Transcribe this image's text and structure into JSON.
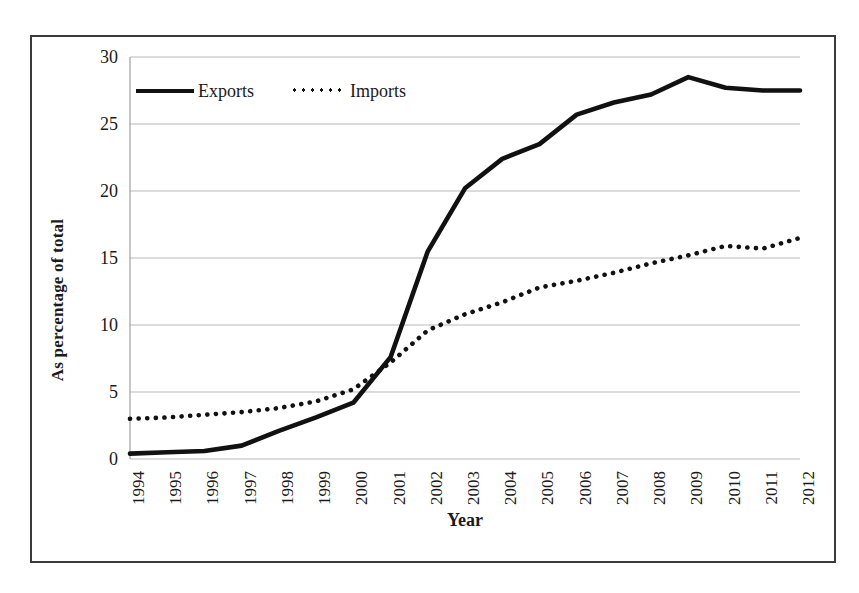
{
  "chart_data": {
    "type": "line",
    "title": "",
    "xlabel": "Year",
    "ylabel": "As percentage of total",
    "categories": [
      "1994",
      "1995",
      "1996",
      "1997",
      "1998",
      "1999",
      "2000",
      "2001",
      "2002",
      "2003",
      "2004",
      "2005",
      "2006",
      "2007",
      "2008",
      "2009",
      "2010",
      "2011",
      "2012"
    ],
    "x": [
      1994,
      1995,
      1996,
      1997,
      1998,
      1999,
      2000,
      2001,
      2002,
      2003,
      2004,
      2005,
      2006,
      2007,
      2008,
      2009,
      2010,
      2011,
      2012
    ],
    "series": [
      {
        "name": "Exports",
        "style": "solid",
        "color": "#111111",
        "values": [
          0.4,
          0.5,
          0.6,
          1.0,
          2.1,
          3.1,
          4.2,
          7.6,
          15.5,
          20.2,
          22.4,
          23.5,
          25.7,
          26.6,
          27.2,
          28.5,
          27.7,
          27.5,
          27.5
        ]
      },
      {
        "name": "Imports",
        "style": "dotted",
        "color": "#111111",
        "values": [
          3.0,
          3.1,
          3.3,
          3.5,
          3.8,
          4.3,
          5.2,
          7.2,
          9.6,
          10.8,
          11.7,
          12.8,
          13.3,
          13.9,
          14.6,
          15.2,
          15.9,
          15.7,
          16.5
        ]
      }
    ],
    "ylim": [
      0,
      30
    ],
    "yticks": [
      0,
      5,
      10,
      15,
      20,
      25,
      30
    ],
    "ytick_labels": [
      "0",
      "5",
      "10",
      "15",
      "20",
      "25",
      "30"
    ],
    "grid": true,
    "grid_axis": "y",
    "legend_position": "top-left-inside",
    "legend": [
      "Exports",
      "Imports"
    ]
  },
  "figure": {
    "border_color": "#3a3a3a",
    "background": "#ffffff",
    "gridline_color": "#b9b9b9"
  }
}
